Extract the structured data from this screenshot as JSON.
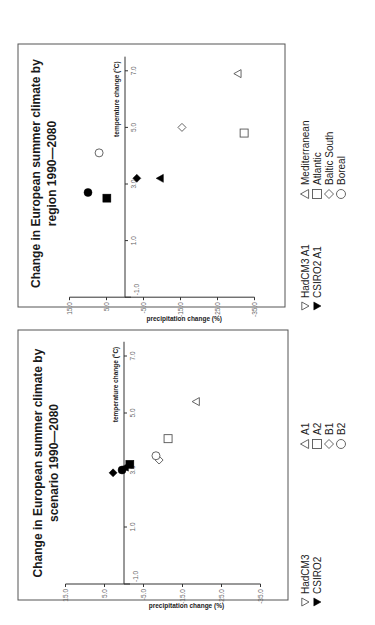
{
  "chart_data": [
    {
      "id": "region",
      "type": "scatter",
      "title": "Change in European summer climate by region 1990—2080",
      "title_lines": [
        "Change in European summer climate by",
        "region 1990—2080"
      ],
      "xlabel": "temperature change (°C)",
      "ylabel": "precipitation change (%)",
      "x_ticks": [
        "1.0",
        "3.0",
        "5.0",
        "7.0"
      ],
      "x_tick_values": [
        1,
        3,
        5,
        7
      ],
      "y_ticks": [
        "15.0",
        "5.0",
        "-5.0",
        "-15.0",
        "-25.0",
        "-35.0"
      ],
      "y_tick_values": [
        15,
        5,
        -5,
        -15,
        -25,
        -35
      ],
      "y_origin_label": "-1.0",
      "xlim": [
        -1,
        7.5
      ],
      "ylim": [
        -35,
        15
      ],
      "grid": false,
      "legend": {
        "models": [
          {
            "label": "HadCM3 A1",
            "marker": "open-triangle-down"
          },
          {
            "label": "CSIRO2 A1",
            "marker": "filled-triangle-down"
          }
        ],
        "groups": [
          {
            "label": "Mediterranean",
            "marker": "triangle"
          },
          {
            "label": "Atlantic",
            "marker": "square"
          },
          {
            "label": "Baltic South",
            "marker": "diamond"
          },
          {
            "label": "Boreal",
            "marker": "circle"
          }
        ]
      },
      "series": [
        {
          "name": "HadCM3 A1",
          "fill": "open",
          "points": [
            {
              "group": "Mediterranean",
              "marker": "triangle",
              "x": 6.9,
              "y": -30.5
            },
            {
              "group": "Atlantic",
              "marker": "square",
              "x": 4.8,
              "y": -32.2
            },
            {
              "group": "Baltic South",
              "marker": "diamond",
              "x": 5.0,
              "y": -15.4
            },
            {
              "group": "Boreal",
              "marker": "circle",
              "x": 4.1,
              "y": 7.0
            }
          ]
        },
        {
          "name": "CSIRO2 A1",
          "fill": "filled",
          "points": [
            {
              "group": "Mediterranean",
              "marker": "triangle",
              "x": 3.2,
              "y": -9.5
            },
            {
              "group": "Atlantic",
              "marker": "square",
              "x": 2.5,
              "y": 4.9
            },
            {
              "group": "Baltic South",
              "marker": "diamond",
              "x": 3.2,
              "y": -3.2
            },
            {
              "group": "Boreal",
              "marker": "circle",
              "x": 2.7,
              "y": 10.0
            }
          ]
        }
      ]
    },
    {
      "id": "scenario",
      "type": "scatter",
      "title": "Change in European summer climate by scenario 1990—2080",
      "title_lines": [
        "Change in European summer climate by",
        "scenario 1990—2080"
      ],
      "xlabel": "temperature change (°C)",
      "ylabel": "precipitation change (%)",
      "x_ticks": [
        "1.0",
        "3.0",
        "5.0",
        "7.0"
      ],
      "x_tick_values": [
        1,
        3,
        5,
        7
      ],
      "y_ticks": [
        "15.0",
        "5.0",
        "-5.0",
        "-15.0",
        "-25.0",
        "-35.0"
      ],
      "y_tick_values": [
        15,
        5,
        -5,
        -15,
        -25,
        -35
      ],
      "y_origin_label": "-1.0",
      "xlim": [
        -1,
        7.5
      ],
      "ylim": [
        -35,
        15
      ],
      "grid": false,
      "legend": {
        "models": [
          {
            "label": "HadCM3",
            "marker": "open-triangle-down"
          },
          {
            "label": "CSIRO2",
            "marker": "filled-triangle-down"
          }
        ],
        "groups": [
          {
            "label": "A1",
            "marker": "triangle"
          },
          {
            "label": "A2",
            "marker": "square"
          },
          {
            "label": "B1",
            "marker": "diamond"
          },
          {
            "label": "B2",
            "marker": "circle"
          }
        ]
      },
      "series": [
        {
          "name": "HadCM3",
          "fill": "open",
          "points": [
            {
              "group": "A1",
              "marker": "triangle",
              "x": 5.4,
              "y": -18.5
            },
            {
              "group": "A2",
              "marker": "square",
              "x": 4.1,
              "y": -11.3
            },
            {
              "group": "B1",
              "marker": "diamond",
              "x": 3.35,
              "y": -9.0
            },
            {
              "group": "B2",
              "marker": "circle",
              "x": 3.5,
              "y": -8.2
            }
          ]
        },
        {
          "name": "CSIRO2",
          "fill": "filled",
          "points": [
            {
              "group": "A1",
              "marker": "triangle",
              "x": 3.1,
              "y": -0.3
            },
            {
              "group": "A2",
              "marker": "square",
              "x": 3.2,
              "y": -1.5
            },
            {
              "group": "B1",
              "marker": "diamond",
              "x": 2.9,
              "y": 2.8
            },
            {
              "group": "B2",
              "marker": "circle",
              "x": 3.0,
              "y": 0.5
            }
          ]
        }
      ]
    }
  ]
}
